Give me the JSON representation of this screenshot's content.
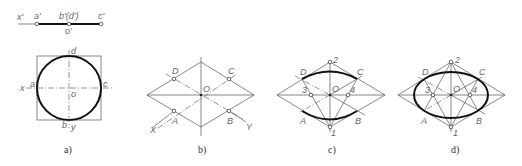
{
  "figure": {
    "panels": [
      {
        "id": "a",
        "caption": "a)",
        "projection_labels": {
          "x": "x'",
          "a": "a'",
          "bd": "b'(d')",
          "c": "c'",
          "o": "o'"
        },
        "plan_labels": {
          "x": "x",
          "a": "a",
          "c": "c",
          "d": "d",
          "b": "b",
          "y": "y",
          "o": "o"
        }
      },
      {
        "id": "b",
        "caption": "b)",
        "labels": {
          "D": "D",
          "C": "C",
          "O": "O",
          "A": "A",
          "B": "B",
          "X": "X",
          "Y": "Y"
        }
      },
      {
        "id": "c",
        "caption": "c)",
        "labels": {
          "p2": "2",
          "D": "D",
          "C": "C",
          "p3": "3",
          "O": "O",
          "p4": "4",
          "A": "A",
          "B": "B",
          "p1": "1"
        }
      },
      {
        "id": "d",
        "caption": "d)",
        "labels": {
          "p2": "2",
          "D": "D",
          "C": "C",
          "p3": "3",
          "O": "O",
          "p4": "4",
          "A": "A",
          "B": "B",
          "p1": "1"
        }
      }
    ]
  }
}
